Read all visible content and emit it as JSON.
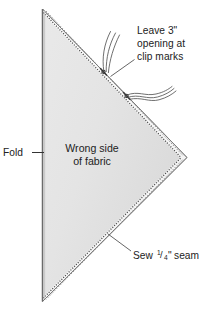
{
  "diagram": {
    "fabric_fill_color": "#e4e4e4",
    "fabric_edge_color": "#6f6f6f",
    "stitch_color": "#4a4a4a",
    "text_color": "#222222",
    "seam_allowance_color": "#ffffff",
    "labels": {
      "fold": "Fold",
      "center_line1": "Wrong side",
      "center_line2": "of fabric",
      "opening_line1": "Leave 3\"",
      "opening_line2": "opening at",
      "opening_line3": "clip marks",
      "seam_prefix": "Sew",
      "seam_numerator": "1",
      "seam_slash": "/",
      "seam_denominator": "4",
      "seam_unit": "\"",
      "seam_suffix": "seam"
    },
    "annotations": {
      "clip_mark_count": "2",
      "opening_size": "3\"",
      "seam_allowance": "1/4\""
    }
  }
}
